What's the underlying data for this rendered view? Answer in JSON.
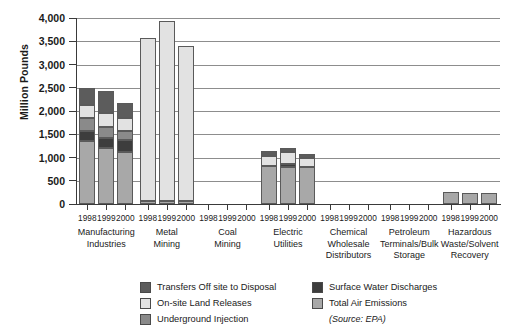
{
  "chart_data": {
    "type": "bar",
    "subtype": "stacked-grouped",
    "title": "",
    "xlabel": "",
    "ylabel": "Million Pounds",
    "ylim": [
      0,
      4000
    ],
    "ytick_labels": [
      "0",
      "500",
      "1,000",
      "1,500",
      "2,000",
      "2,500",
      "3,000",
      "3,500",
      "4,000"
    ],
    "ytick_values": [
      0,
      500,
      1000,
      1500,
      2000,
      2500,
      3000,
      3500,
      4000
    ],
    "grid": "horizontal",
    "legend_position": "bottom",
    "source_note": "(Source: EPA)",
    "years": [
      "1998",
      "1999",
      "2000"
    ],
    "categories": [
      "Manufacturing Industries",
      "Metal Mining",
      "Coal Mining",
      "Electric Utilities",
      "Chemical Wholesale Distributors",
      "Petroleum Terminals/Bulk Storage",
      "Hazardous Waste/Solvent Recovery"
    ],
    "category_lines": [
      [
        "Manufacturing",
        "Industries"
      ],
      [
        "Metal",
        "Mining"
      ],
      [
        "Coal",
        "Mining"
      ],
      [
        "Electric",
        "Utilities"
      ],
      [
        "Chemical",
        "Wholesale",
        "Distributors"
      ],
      [
        "Petroleum",
        "Terminals/Bulk",
        "Storage"
      ],
      [
        "Hazardous",
        "Waste/Solvent",
        "Recovery"
      ]
    ],
    "series": [
      {
        "name": "Total Air Emissions",
        "color": "#a8a8a8"
      },
      {
        "name": "Surface Water Discharges",
        "color": "#3d3d3d"
      },
      {
        "name": "Underground Injection",
        "color": "#8a8a8a"
      },
      {
        "name": "On-site Land Releases",
        "color": "#e2e2e2"
      },
      {
        "name": "Transfers Off site to Disposal",
        "color": "#5c5c5c"
      }
    ],
    "stacks": [
      {
        "category": "Manufacturing Industries",
        "bars": [
          {
            "year": "1998",
            "total": 2500,
            "segments": [
              1350,
              230,
              260,
              280,
              380
            ]
          },
          {
            "year": "1999",
            "total": 2430,
            "segments": [
              1200,
              220,
              240,
              290,
              480
            ]
          },
          {
            "year": "2000",
            "total": 2180,
            "segments": [
              1120,
              250,
              200,
              290,
              320
            ]
          }
        ]
      },
      {
        "category": "Metal Mining",
        "bars": [
          {
            "year": "1998",
            "total": 3570,
            "segments": [
              60,
              0,
              0,
              3510,
              0
            ]
          },
          {
            "year": "1999",
            "total": 3940,
            "segments": [
              60,
              0,
              0,
              3880,
              0
            ]
          },
          {
            "year": "2000",
            "total": 3400,
            "segments": [
              60,
              0,
              0,
              3340,
              0
            ]
          }
        ]
      },
      {
        "category": "Coal Mining",
        "bars": [
          {
            "year": "1998",
            "total": 0,
            "segments": [
              0,
              0,
              0,
              0,
              0
            ]
          },
          {
            "year": "1999",
            "total": 0,
            "segments": [
              0,
              0,
              0,
              0,
              0
            ]
          },
          {
            "year": "2000",
            "total": 0,
            "segments": [
              0,
              0,
              0,
              0,
              0
            ]
          }
        ]
      },
      {
        "category": "Electric Utilities",
        "bars": [
          {
            "year": "1998",
            "total": 1150,
            "segments": [
              810,
              0,
              0,
              230,
              110
            ]
          },
          {
            "year": "1999",
            "total": 1210,
            "segments": [
              800,
              70,
              0,
              240,
              100
            ]
          },
          {
            "year": "2000",
            "total": 1080,
            "segments": [
              800,
              0,
              0,
              190,
              90
            ]
          }
        ]
      },
      {
        "category": "Chemical Wholesale Distributors",
        "bars": [
          {
            "year": "1998",
            "total": 0,
            "segments": [
              0,
              0,
              0,
              0,
              0
            ]
          },
          {
            "year": "1999",
            "total": 0,
            "segments": [
              0,
              0,
              0,
              0,
              0
            ]
          },
          {
            "year": "2000",
            "total": 0,
            "segments": [
              0,
              0,
              0,
              0,
              0
            ]
          }
        ]
      },
      {
        "category": "Petroleum Terminals/Bulk Storage",
        "bars": [
          {
            "year": "1998",
            "total": 0,
            "segments": [
              0,
              0,
              0,
              0,
              0
            ]
          },
          {
            "year": "1999",
            "total": 0,
            "segments": [
              0,
              0,
              0,
              0,
              0
            ]
          },
          {
            "year": "2000",
            "total": 0,
            "segments": [
              0,
              0,
              0,
              0,
              0
            ]
          }
        ]
      },
      {
        "category": "Hazardous Waste/Solvent Recovery",
        "bars": [
          {
            "year": "1998",
            "total": 250,
            "segments": [
              250,
              0,
              0,
              0,
              0
            ]
          },
          {
            "year": "1999",
            "total": 245,
            "segments": [
              245,
              0,
              0,
              0,
              0
            ]
          },
          {
            "year": "2000",
            "total": 240,
            "segments": [
              240,
              0,
              0,
              0,
              0
            ]
          }
        ]
      }
    ]
  },
  "legend": {
    "column_left": [
      {
        "label": "Transfers Off site to Disposal",
        "color": "#5c5c5c"
      },
      {
        "label": "On-site Land Releases",
        "color": "#e2e2e2"
      },
      {
        "label": "Underground Injection",
        "color": "#8a8a8a"
      }
    ],
    "column_right": [
      {
        "label": "Surface Water Discharges",
        "color": "#3d3d3d"
      },
      {
        "label": "Total Air Emissions",
        "color": "#a8a8a8"
      }
    ],
    "source": "(Source: EPA)"
  }
}
